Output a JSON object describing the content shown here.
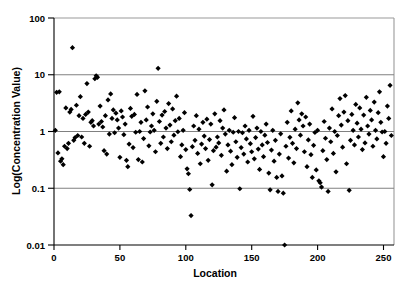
{
  "chart_data": {
    "type": "scatter",
    "title": "",
    "xlabel": "Location",
    "ylabel": "Log(Concentration Value)",
    "yscale": "log",
    "xscale": "linear",
    "xlim": [
      0,
      258
    ],
    "ylim": [
      0.01,
      100
    ],
    "xticks": [
      0,
      50,
      100,
      150,
      200,
      250
    ],
    "xticklabels": [
      "0",
      "50",
      "100",
      "150",
      "200",
      "250"
    ],
    "yticks": [
      0.01,
      0.1,
      1,
      10,
      100
    ],
    "yticklabels": [
      "0.01",
      "0.1",
      "1",
      "10",
      "100"
    ],
    "grid": "horizontal-at-y-ticks",
    "legend": "none",
    "marker": "filled-diamond",
    "marker_color": "#000000",
    "marker_size": 2.6,
    "n_points": 256,
    "points": [
      [
        1,
        1.05
      ],
      [
        2,
        4.9
      ],
      [
        3,
        0.42
      ],
      [
        4,
        5.0
      ],
      [
        5,
        0.3
      ],
      [
        6,
        0.33
      ],
      [
        7,
        0.26
      ],
      [
        8,
        0.55
      ],
      [
        9,
        2.6
      ],
      [
        10,
        0.5
      ],
      [
        11,
        0.62
      ],
      [
        12,
        2.2
      ],
      [
        13,
        2.45
      ],
      [
        14,
        30.0
      ],
      [
        15,
        0.7
      ],
      [
        16,
        0.78
      ],
      [
        17,
        2.9
      ],
      [
        18,
        0.85
      ],
      [
        19,
        1.9
      ],
      [
        20,
        4.1
      ],
      [
        21,
        0.8
      ],
      [
        22,
        1.7
      ],
      [
        23,
        0.62
      ],
      [
        24,
        2.0
      ],
      [
        25,
        7.0
      ],
      [
        26,
        2.2
      ],
      [
        27,
        0.55
      ],
      [
        28,
        1.45
      ],
      [
        29,
        1.55
      ],
      [
        30,
        1.25
      ],
      [
        31,
        8.5
      ],
      [
        32,
        9.6
      ],
      [
        33,
        9.0
      ],
      [
        34,
        1.35
      ],
      [
        35,
        2.8
      ],
      [
        36,
        1.5
      ],
      [
        37,
        1.2
      ],
      [
        38,
        0.46
      ],
      [
        39,
        1.9
      ],
      [
        40,
        0.4
      ],
      [
        41,
        3.6
      ],
      [
        42,
        0.9
      ],
      [
        43,
        4.6
      ],
      [
        44,
        1.7
      ],
      [
        45,
        2.4
      ],
      [
        46,
        0.95
      ],
      [
        47,
        2.1
      ],
      [
        48,
        1.6
      ],
      [
        49,
        1.15
      ],
      [
        50,
        0.35
      ],
      [
        51,
        2.3
      ],
      [
        52,
        1.8
      ],
      [
        53,
        0.88
      ],
      [
        54,
        1.35
      ],
      [
        55,
        0.31
      ],
      [
        56,
        0.24
      ],
      [
        57,
        0.6
      ],
      [
        58,
        2.55
      ],
      [
        59,
        1.85
      ],
      [
        60,
        0.52
      ],
      [
        61,
        2.0
      ],
      [
        62,
        0.97
      ],
      [
        63,
        4.5
      ],
      [
        64,
        0.32
      ],
      [
        65,
        1.0
      ],
      [
        66,
        1.45
      ],
      [
        67,
        0.29
      ],
      [
        68,
        0.75
      ],
      [
        69,
        5.2
      ],
      [
        70,
        1.6
      ],
      [
        71,
        2.7
      ],
      [
        72,
        0.56
      ],
      [
        73,
        0.98
      ],
      [
        74,
        1.25
      ],
      [
        75,
        2.05
      ],
      [
        76,
        1.05
      ],
      [
        77,
        0.44
      ],
      [
        78,
        3.4
      ],
      [
        79,
        13.0
      ],
      [
        80,
        1.5
      ],
      [
        81,
        0.62
      ],
      [
        82,
        1.95
      ],
      [
        83,
        0.8
      ],
      [
        84,
        2.25
      ],
      [
        85,
        1.15
      ],
      [
        86,
        0.5
      ],
      [
        87,
        3.1
      ],
      [
        88,
        1.3
      ],
      [
        89,
        0.66
      ],
      [
        90,
        2.5
      ],
      [
        91,
        0.86
      ],
      [
        92,
        1.55
      ],
      [
        93,
        4.2
      ],
      [
        94,
        0.99
      ],
      [
        95,
        1.7
      ],
      [
        96,
        0.36
      ],
      [
        97,
        0.58
      ],
      [
        98,
        1.05
      ],
      [
        99,
        2.15
      ],
      [
        100,
        0.48
      ],
      [
        101,
        0.22
      ],
      [
        102,
        0.18
      ],
      [
        103,
        0.095
      ],
      [
        104,
        0.033
      ],
      [
        105,
        0.54
      ],
      [
        106,
        1.25
      ],
      [
        107,
        0.7
      ],
      [
        108,
        1.9
      ],
      [
        109,
        0.41
      ],
      [
        110,
        1.1
      ],
      [
        111,
        0.27
      ],
      [
        112,
        0.6
      ],
      [
        113,
        1.45
      ],
      [
        114,
        0.83
      ],
      [
        115,
        0.5
      ],
      [
        116,
        1.65
      ],
      [
        117,
        0.31
      ],
      [
        118,
        0.72
      ],
      [
        119,
        1.35
      ],
      [
        120,
        0.115
      ],
      [
        121,
        0.46
      ],
      [
        122,
        2.05
      ],
      [
        123,
        0.53
      ],
      [
        124,
        0.8
      ],
      [
        125,
        0.63
      ],
      [
        126,
        1.55
      ],
      [
        127,
        0.38
      ],
      [
        128,
        1.15
      ],
      [
        129,
        2.4
      ],
      [
        130,
        0.9
      ],
      [
        131,
        0.2
      ],
      [
        132,
        0.58
      ],
      [
        133,
        1.05
      ],
      [
        134,
        0.45
      ],
      [
        135,
        0.26
      ],
      [
        136,
        0.97
      ],
      [
        137,
        1.75
      ],
      [
        138,
        0.66
      ],
      [
        139,
        0.35
      ],
      [
        140,
        1.0
      ],
      [
        141,
        0.098
      ],
      [
        142,
        0.52
      ],
      [
        143,
        0.95
      ],
      [
        144,
        0.4
      ],
      [
        145,
        1.25
      ],
      [
        146,
        0.74
      ],
      [
        147,
        0.29
      ],
      [
        148,
        1.05
      ],
      [
        149,
        0.61
      ],
      [
        150,
        0.44
      ],
      [
        151,
        1.85
      ],
      [
        152,
        0.33
      ],
      [
        153,
        0.78
      ],
      [
        154,
        1.15
      ],
      [
        155,
        0.49
      ],
      [
        156,
        0.215
      ],
      [
        157,
        1.0
      ],
      [
        158,
        0.58
      ],
      [
        159,
        0.36
      ],
      [
        160,
        0.86
      ],
      [
        161,
        1.35
      ],
      [
        162,
        0.64
      ],
      [
        163,
        0.185
      ],
      [
        164,
        0.094
      ],
      [
        165,
        0.47
      ],
      [
        166,
        1.05
      ],
      [
        167,
        0.3
      ],
      [
        168,
        0.7
      ],
      [
        169,
        0.155
      ],
      [
        170,
        0.088
      ],
      [
        171,
        0.4
      ],
      [
        172,
        0.91
      ],
      [
        173,
        0.165
      ],
      [
        174,
        0.082
      ],
      [
        175,
        0.01
      ],
      [
        176,
        0.55
      ],
      [
        177,
        1.45
      ],
      [
        178,
        0.34
      ],
      [
        179,
        0.79
      ],
      [
        180,
        2.3
      ],
      [
        181,
        0.62
      ],
      [
        182,
        0.28
      ],
      [
        183,
        1.1
      ],
      [
        184,
        0.5
      ],
      [
        185,
        3.2
      ],
      [
        186,
        1.6
      ],
      [
        187,
        0.86
      ],
      [
        188,
        2.05
      ],
      [
        189,
        1.25
      ],
      [
        190,
        0.44
      ],
      [
        191,
        1.8
      ],
      [
        192,
        0.24
      ],
      [
        193,
        0.71
      ],
      [
        194,
        1.35
      ],
      [
        195,
        0.39
      ],
      [
        196,
        0.155
      ],
      [
        197,
        0.57
      ],
      [
        198,
        0.96
      ],
      [
        199,
        0.21
      ],
      [
        200,
        1.05
      ],
      [
        201,
        0.135
      ],
      [
        202,
        0.125
      ],
      [
        203,
        0.105
      ],
      [
        204,
        0.46
      ],
      [
        205,
        1.5
      ],
      [
        206,
        0.76
      ],
      [
        207,
        0.32
      ],
      [
        208,
        0.088
      ],
      [
        209,
        1.15
      ],
      [
        210,
        0.66
      ],
      [
        211,
        2.5
      ],
      [
        212,
        0.41
      ],
      [
        213,
        1.0
      ],
      [
        214,
        0.195
      ],
      [
        215,
        0.85
      ],
      [
        216,
        1.9
      ],
      [
        217,
        3.8
      ],
      [
        218,
        1.3
      ],
      [
        219,
        0.53
      ],
      [
        220,
        2.2
      ],
      [
        221,
        4.3
      ],
      [
        222,
        0.27
      ],
      [
        223,
        1.55
      ],
      [
        224,
        0.092
      ],
      [
        225,
        0.7
      ],
      [
        226,
        2.0
      ],
      [
        227,
        1.05
      ],
      [
        228,
        0.58
      ],
      [
        229,
        3.0
      ],
      [
        230,
        1.4
      ],
      [
        231,
        0.8
      ],
      [
        232,
        2.6
      ],
      [
        233,
        1.1
      ],
      [
        234,
        0.48
      ],
      [
        235,
        1.95
      ],
      [
        236,
        0.63
      ],
      [
        237,
        4.0
      ],
      [
        238,
        1.25
      ],
      [
        239,
        0.9
      ],
      [
        240,
        2.35
      ],
      [
        241,
        1.6
      ],
      [
        242,
        0.55
      ],
      [
        243,
        3.3
      ],
      [
        244,
        1.05
      ],
      [
        245,
        0.74
      ],
      [
        246,
        2.15
      ],
      [
        247,
        5.0
      ],
      [
        248,
        1.45
      ],
      [
        249,
        0.98
      ],
      [
        250,
        0.36
      ],
      [
        251,
        1.0
      ],
      [
        252,
        0.62
      ],
      [
        253,
        2.8
      ],
      [
        254,
        1.7
      ],
      [
        255,
        6.5
      ],
      [
        256,
        0.85
      ]
    ]
  }
}
